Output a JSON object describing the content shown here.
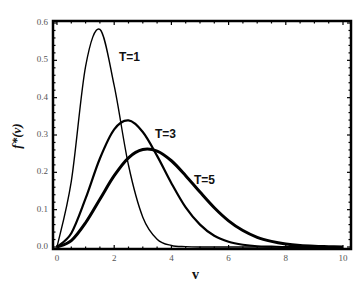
{
  "chart_data": {
    "type": "line",
    "title": "",
    "xlabel": "v",
    "ylabel": "f*(v)",
    "xlim": [
      0,
      10
    ],
    "ylim": [
      0,
      0.6
    ],
    "xticks": [
      "0",
      "2",
      "4",
      "6",
      "8",
      "10"
    ],
    "yticks": [
      "0.0",
      "0.1",
      "0.2",
      "0.3",
      "0.4",
      "0.5",
      "0.6"
    ],
    "grid": false,
    "legend": "inline labels",
    "x": [
      0,
      0.5,
      1,
      1.5,
      2,
      2.5,
      3,
      3.5,
      4,
      4.5,
      5,
      5.5,
      6,
      6.5,
      7,
      7.5,
      8,
      8.5,
      9,
      9.5,
      10
    ],
    "series": [
      {
        "name": "T=1",
        "line_width": 1.4,
        "values": [
          0,
          0.176,
          0.484,
          0.583,
          0.432,
          0.219,
          0.08,
          0.021,
          0.004,
          0.001,
          0,
          0,
          0,
          0,
          0,
          0,
          0,
          0,
          0,
          0,
          0
        ]
      },
      {
        "name": "T=3",
        "line_width": 2.2,
        "values": [
          0,
          0.037,
          0.13,
          0.237,
          0.315,
          0.339,
          0.308,
          0.244,
          0.171,
          0.106,
          0.06,
          0.03,
          0.014,
          0.006,
          0.002,
          0.001,
          0,
          0,
          0,
          0,
          0
        ]
      },
      {
        "name": "T=5",
        "line_width": 3.0,
        "values": [
          0,
          0.017,
          0.065,
          0.128,
          0.191,
          0.239,
          0.261,
          0.257,
          0.231,
          0.191,
          0.147,
          0.105,
          0.07,
          0.044,
          0.026,
          0.015,
          0.008,
          0.004,
          0.002,
          0.001,
          0
        ]
      }
    ],
    "annotations": [
      {
        "text": "T=1",
        "x": 2.2,
        "y": 0.5
      },
      {
        "text": "T=3",
        "x": 3.5,
        "y": 0.3
      },
      {
        "text": "T=5",
        "x": 4.8,
        "y": 0.18
      }
    ]
  },
  "labels": {
    "x": "v",
    "y": "f*(v)",
    "t1": "T=1",
    "t3": "T=3",
    "t5": "T=5"
  }
}
